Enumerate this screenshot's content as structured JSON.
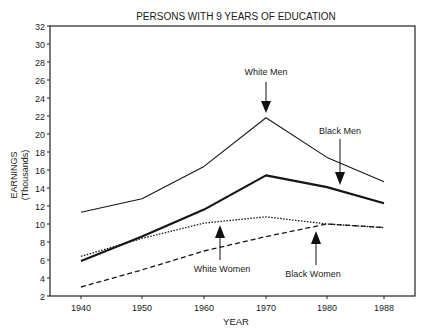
{
  "chart_data": {
    "type": "line",
    "title": "PERSONS WITH 9 YEARS OF EDUCATION",
    "xlabel": "YEAR",
    "ylabel": [
      "EARNINGS",
      "(Thousands)"
    ],
    "categories": [
      "1940",
      "1950",
      "1960",
      "1970",
      "1980",
      "1988"
    ],
    "ylim": [
      2,
      32
    ],
    "yticks": [
      2,
      4,
      6,
      8,
      10,
      12,
      14,
      16,
      18,
      20,
      22,
      24,
      26,
      28,
      30,
      32
    ],
    "grid": false,
    "legend": "none (inline arrow annotations)",
    "series": [
      {
        "name": "White Men",
        "style": "thin-solid",
        "values": [
          11.3,
          12.8,
          16.4,
          21.8,
          17.4,
          14.7
        ]
      },
      {
        "name": "Black Men",
        "style": "thick-solid",
        "values": [
          5.9,
          8.6,
          11.6,
          15.4,
          14.1,
          12.3
        ]
      },
      {
        "name": "White Women",
        "style": "dotted",
        "values": [
          6.4,
          8.4,
          10.1,
          10.8,
          10.0,
          9.6
        ]
      },
      {
        "name": "Black Women",
        "style": "dashed",
        "values": [
          3.0,
          4.9,
          7.0,
          8.6,
          10.0,
          9.6
        ]
      }
    ],
    "annotations": [
      {
        "text": "White Men",
        "arrow": "down",
        "target_series": "White Men",
        "at": "1970"
      },
      {
        "text": "Black Men",
        "arrow": "down",
        "target_series": "Black Men",
        "at": "1980-1988"
      },
      {
        "text": "White Women",
        "arrow": "up",
        "target_series": "White Women",
        "at": "1960"
      },
      {
        "text": "Black Women",
        "arrow": "up",
        "target_series": "Black Women",
        "at": "1980"
      }
    ]
  }
}
